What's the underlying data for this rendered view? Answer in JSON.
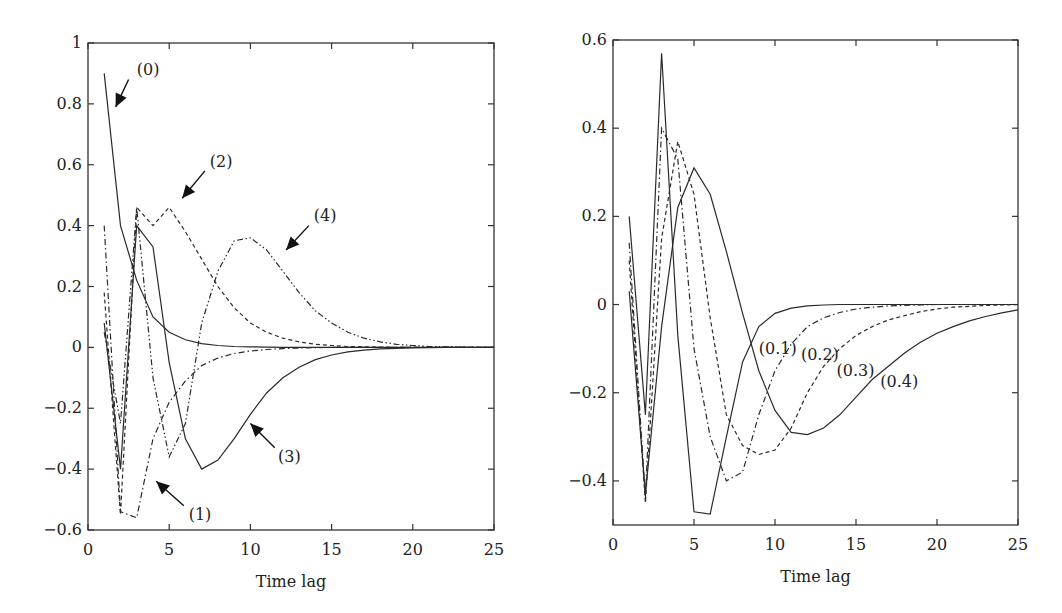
{
  "chart_data": [
    {
      "type": "line",
      "title": "",
      "xlabel": "Time lag",
      "ylabel": "",
      "xlim": [
        0,
        25
      ],
      "ylim": [
        -0.6,
        1
      ],
      "xticks": [
        0,
        5,
        10,
        15,
        20,
        25
      ],
      "yticks": [
        -0.6,
        -0.4,
        -0.2,
        0,
        0.2,
        0.4,
        0.6,
        0.8,
        1
      ],
      "ytick_labels": [
        "−0.6",
        "−0.4",
        "−0.2",
        "0",
        "0.2",
        "0.4",
        "0.6",
        "0.8",
        "1"
      ],
      "grid": false,
      "legend": "inline annotations with arrows",
      "x": [
        1,
        2,
        3,
        4,
        5,
        6,
        7,
        8,
        9,
        10,
        11,
        12,
        13,
        14,
        15,
        16,
        17,
        18,
        19,
        20,
        21,
        22,
        23,
        24,
        25
      ],
      "series": [
        {
          "name": "(0)",
          "style": "solid",
          "values": [
            0.9,
            0.4,
            0.22,
            0.1,
            0.05,
            0.025,
            0.012,
            0.006,
            0.003,
            0.002,
            0.001,
            0,
            0,
            0,
            0,
            0,
            0,
            0,
            0,
            0,
            0,
            0,
            0,
            0,
            0
          ]
        },
        {
          "name": "(1)",
          "style": "dashdot",
          "values": [
            0.4,
            -0.54,
            -0.56,
            -0.3,
            -0.18,
            -0.11,
            -0.06,
            -0.035,
            -0.02,
            -0.012,
            -0.007,
            -0.004,
            -0.002,
            -0.001,
            0,
            0,
            0,
            0,
            0,
            0,
            0,
            0,
            0,
            0,
            0
          ]
        },
        {
          "name": "(2)",
          "style": "dashed",
          "values": [
            0.18,
            -0.55,
            0.46,
            0.4,
            0.46,
            0.38,
            0.29,
            0.2,
            0.13,
            0.08,
            0.05,
            0.03,
            0.018,
            0.01,
            0.006,
            0.003,
            0.002,
            0.001,
            0,
            0,
            0,
            0,
            0,
            0,
            0
          ]
        },
        {
          "name": "(3)",
          "style": "solid",
          "values": [
            0.08,
            -0.4,
            0.4,
            0.33,
            -0.05,
            -0.3,
            -0.4,
            -0.37,
            -0.3,
            -0.22,
            -0.15,
            -0.1,
            -0.065,
            -0.04,
            -0.025,
            -0.015,
            -0.009,
            -0.005,
            -0.003,
            -0.002,
            -0.001,
            0,
            0,
            0,
            0
          ]
        },
        {
          "name": "(4)",
          "style": "dashdotdot",
          "values": [
            0.05,
            -0.25,
            0.46,
            -0.1,
            -0.36,
            -0.25,
            0.08,
            0.25,
            0.35,
            0.36,
            0.32,
            0.25,
            0.18,
            0.12,
            0.08,
            0.05,
            0.03,
            0.018,
            0.01,
            0.006,
            0.003,
            0.002,
            0.001,
            0,
            0
          ]
        }
      ],
      "annotations": [
        {
          "label": "(0)",
          "text_x": 3.0,
          "text_y": 0.91,
          "arrow_from": [
            2.5,
            0.88
          ],
          "arrow_to": [
            1.7,
            0.79
          ]
        },
        {
          "label": "(2)",
          "text_x": 7.5,
          "text_y": 0.61,
          "arrow_from": [
            7.2,
            0.58
          ],
          "arrow_to": [
            5.8,
            0.49
          ]
        },
        {
          "name": "(4)",
          "label": "(4)",
          "text_x": 13.9,
          "text_y": 0.43,
          "arrow_from": [
            13.6,
            0.4
          ],
          "arrow_to": [
            12.2,
            0.32
          ]
        },
        {
          "label": "(3)",
          "text_x": 11.7,
          "text_y": -0.36,
          "arrow_from": [
            11.5,
            -0.33
          ],
          "arrow_to": [
            10.0,
            -0.25
          ]
        },
        {
          "label": "(1)",
          "text_x": 6.2,
          "text_y": -0.55,
          "arrow_from": [
            5.9,
            -0.52
          ],
          "arrow_to": [
            4.2,
            -0.44
          ]
        }
      ]
    },
    {
      "type": "line",
      "title": "",
      "xlabel": "Time lag",
      "ylabel": "",
      "xlim": [
        0,
        25
      ],
      "ylim": [
        -0.5,
        0.6
      ],
      "xticks": [
        0,
        5,
        10,
        15,
        20,
        25
      ],
      "yticks": [
        -0.4,
        -0.2,
        0,
        0.2,
        0.4,
        0.6
      ],
      "ytick_labels": [
        "−0.4",
        "−0.2",
        "0",
        "0.2",
        "0.4",
        "0.6"
      ],
      "grid": false,
      "legend": "inline labels",
      "x": [
        1,
        2,
        3,
        4,
        5,
        6,
        7,
        8,
        9,
        10,
        11,
        12,
        13,
        14,
        15,
        16,
        17,
        18,
        19,
        20,
        21,
        22,
        23,
        24,
        25
      ],
      "series": [
        {
          "name": "(0.1)",
          "style": "solid",
          "values": [
            0.2,
            -0.25,
            0.57,
            -0.07,
            -0.47,
            -0.475,
            -0.3,
            -0.13,
            -0.05,
            -0.02,
            -0.008,
            -0.003,
            -0.001,
            0,
            0,
            0,
            0,
            0,
            0,
            0,
            0,
            0,
            0,
            0,
            0
          ]
        },
        {
          "name": "(0.2)",
          "style": "dashdot",
          "values": [
            0.14,
            -0.44,
            0.4,
            0.33,
            -0.1,
            -0.3,
            -0.4,
            -0.38,
            -0.25,
            -0.15,
            -0.09,
            -0.05,
            -0.03,
            -0.018,
            -0.01,
            -0.006,
            -0.003,
            -0.002,
            -0.001,
            0,
            0,
            0,
            0,
            0,
            0
          ]
        },
        {
          "name": "(0.3)",
          "style": "dashed",
          "values": [
            0.1,
            -0.45,
            0.15,
            0.37,
            0.25,
            -0.03,
            -0.25,
            -0.32,
            -0.34,
            -0.33,
            -0.28,
            -0.2,
            -0.14,
            -0.1,
            -0.07,
            -0.05,
            -0.035,
            -0.025,
            -0.016,
            -0.01,
            -0.006,
            -0.004,
            -0.002,
            -0.001,
            0
          ]
        },
        {
          "name": "(0.4)",
          "style": "solid",
          "values": [
            0.03,
            -0.43,
            -0.05,
            0.22,
            0.31,
            0.25,
            0.12,
            -0.02,
            -0.15,
            -0.24,
            -0.29,
            -0.295,
            -0.28,
            -0.25,
            -0.21,
            -0.17,
            -0.14,
            -0.11,
            -0.085,
            -0.065,
            -0.05,
            -0.037,
            -0.027,
            -0.019,
            -0.012
          ]
        }
      ],
      "annotations": [
        {
          "label": "(0.1)",
          "text_x": 9.0,
          "text_y": -0.1
        },
        {
          "label": "(0.2)",
          "text_x": 11.6,
          "text_y": -0.115
        },
        {
          "label": "(0.3)",
          "text_x": 13.8,
          "text_y": -0.15
        },
        {
          "label": "(0.4)",
          "text_x": 16.5,
          "text_y": -0.175
        }
      ]
    }
  ],
  "panels": [
    {
      "id": "left",
      "x_axis_title": "Time lag"
    },
    {
      "id": "right",
      "x_axis_title": "Time lag"
    }
  ]
}
